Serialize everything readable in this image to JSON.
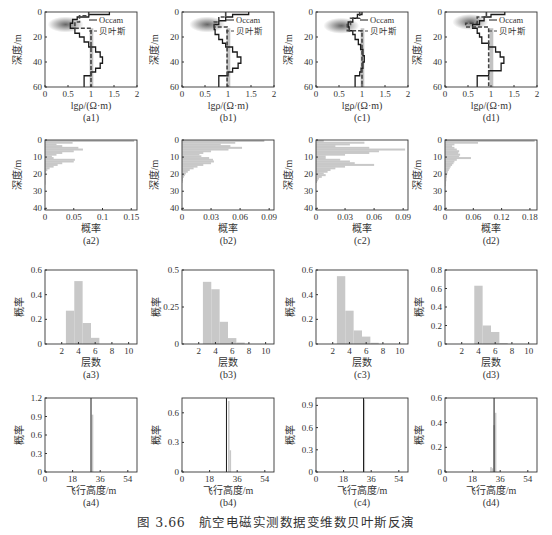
{
  "figure": {
    "caption": "图 3.66　航空电磁实测数据变维数贝叶斯反演"
  },
  "colors": {
    "frame": "#333333",
    "bar": "#c8c8c8",
    "occam": "#1a1a1a",
    "bayes": "#444444",
    "density": "#555555"
  },
  "chart_data": [
    {
      "id": "a1",
      "type": "line",
      "label": "(a1)",
      "xlabel": "lgρ/(Ω·m)",
      "ylabel": "深度/m",
      "xlim": [
        0,
        2
      ],
      "ylim": [
        60,
        0
      ],
      "xticks": [
        "0",
        "0.5",
        "1",
        "1.5",
        "2"
      ],
      "yticks": [
        "0",
        "20",
        "40",
        "60"
      ],
      "legend": [
        "Occam",
        "贝叶斯"
      ],
      "series": [
        {
          "name": "Occam",
          "steps": [
            [
              0,
              1.4
            ],
            [
              2,
              0.95
            ],
            [
              4,
              0.7
            ],
            [
              6,
              0.6
            ],
            [
              9,
              0.55
            ],
            [
              13,
              0.65
            ],
            [
              17,
              0.75
            ],
            [
              20,
              0.85
            ],
            [
              24,
              0.95
            ],
            [
              28,
              1.1
            ],
            [
              32,
              1.2
            ],
            [
              36,
              1.25
            ],
            [
              41,
              1.2
            ],
            [
              45,
              1.1
            ],
            [
              48,
              1.0
            ],
            [
              51,
              0.85
            ],
            [
              60,
              0.85
            ]
          ]
        },
        {
          "name": "贝叶斯",
          "steps": [
            [
              0,
              0.95
            ],
            [
              3,
              0.75
            ],
            [
              8,
              0.65
            ],
            [
              13,
              1.0
            ],
            [
              60,
              1.0
            ]
          ]
        }
      ],
      "density_center": {
        "x": 0.45,
        "depth": 10
      }
    },
    {
      "id": "b1",
      "type": "line",
      "label": "(b1)",
      "xlabel": "lgρ/(Ω·m)",
      "ylabel": "深度/m",
      "xlim": [
        0,
        2
      ],
      "ylim": [
        60,
        0
      ],
      "xticks": [
        "0",
        "0.5",
        "1",
        "1.5",
        "2"
      ],
      "yticks": [
        "0",
        "20",
        "40",
        "60"
      ],
      "legend": [
        "Occam",
        "贝叶斯"
      ],
      "series": [
        {
          "name": "Occam",
          "steps": [
            [
              0,
              1.45
            ],
            [
              2,
              1.1
            ],
            [
              4,
              0.95
            ],
            [
              7,
              0.8
            ],
            [
              10,
              0.7
            ],
            [
              14,
              0.72
            ],
            [
              18,
              0.8
            ],
            [
              22,
              0.88
            ],
            [
              25,
              0.95
            ],
            [
              28,
              1.1
            ],
            [
              32,
              1.2
            ],
            [
              36,
              1.28
            ],
            [
              41,
              1.22
            ],
            [
              45,
              1.1
            ],
            [
              48,
              1.0
            ],
            [
              51,
              0.8
            ],
            [
              60,
              0.8
            ]
          ]
        },
        {
          "name": "贝叶斯",
          "steps": [
            [
              0,
              0.95
            ],
            [
              4,
              0.8
            ],
            [
              8,
              0.7
            ],
            [
              12,
              0.98
            ],
            [
              60,
              0.98
            ]
          ]
        }
      ],
      "density_center": {
        "x": 0.55,
        "depth": 10
      }
    },
    {
      "id": "c1",
      "type": "line",
      "label": "(c1)",
      "xlabel": "lgρ/(Ω·m)",
      "ylabel": "深度/m",
      "xlim": [
        0,
        2
      ],
      "ylim": [
        60,
        0
      ],
      "xticks": [
        "0",
        "0.5",
        "1",
        "1.5",
        "2"
      ],
      "yticks": [
        "0",
        "20",
        "40",
        "60"
      ],
      "legend": [
        "Occam",
        "贝叶斯"
      ],
      "series": [
        {
          "name": "Occam",
          "steps": [
            [
              0,
              1.0
            ],
            [
              2,
              0.9
            ],
            [
              5,
              0.8
            ],
            [
              8,
              0.7
            ],
            [
              12,
              0.72
            ],
            [
              15,
              0.8
            ],
            [
              18,
              0.85
            ],
            [
              22,
              0.92
            ],
            [
              26,
              0.97
            ],
            [
              30,
              1.02
            ],
            [
              35,
              1.05
            ],
            [
              40,
              1.02
            ],
            [
              45,
              0.98
            ],
            [
              48,
              0.95
            ],
            [
              51,
              0.85
            ],
            [
              60,
              0.85
            ]
          ]
        },
        {
          "name": "贝叶斯",
          "steps": [
            [
              0,
              0.95
            ],
            [
              5,
              0.75
            ],
            [
              10,
              0.68
            ],
            [
              15,
              1.0
            ],
            [
              60,
              1.0
            ]
          ]
        }
      ],
      "density_center": {
        "x": 0.55,
        "depth": 11
      }
    },
    {
      "id": "d1",
      "type": "line",
      "label": "(d1)",
      "xlabel": "lgρ/(Ω·m)",
      "ylabel": "深度/m",
      "xlim": [
        0,
        2
      ],
      "ylim": [
        60,
        0
      ],
      "xticks": [
        "0",
        "0.5",
        "1",
        "1.5",
        "2"
      ],
      "yticks": [
        "0",
        "20",
        "40",
        "60"
      ],
      "legend": [
        "Occam",
        "贝叶斯"
      ],
      "series": [
        {
          "name": "Occam",
          "steps": [
            [
              0,
              1.3
            ],
            [
              2,
              1.0
            ],
            [
              4,
              0.85
            ],
            [
              7,
              0.75
            ],
            [
              10,
              0.6
            ],
            [
              13,
              0.7
            ],
            [
              17,
              0.75
            ],
            [
              20,
              0.8
            ],
            [
              25,
              0.95
            ],
            [
              28,
              1.1
            ],
            [
              32,
              1.2
            ],
            [
              36,
              1.28
            ],
            [
              41,
              1.22
            ],
            [
              47,
              0.95
            ],
            [
              51,
              0.7
            ],
            [
              60,
              0.7
            ]
          ]
        },
        {
          "name": "贝叶斯",
          "steps": [
            [
              0,
              0.9
            ],
            [
              4,
              0.7
            ],
            [
              9,
              0.45
            ],
            [
              12,
              0.95
            ],
            [
              60,
              0.95
            ]
          ]
        }
      ],
      "density_center": {
        "x": 0.55,
        "depth": 8
      }
    },
    {
      "id": "a2",
      "type": "bar",
      "orientation": "horizontal",
      "label": "(a2)",
      "xlabel": "概率",
      "ylabel": "深度/m",
      "xlim": [
        0,
        0.16
      ],
      "ylim": [
        41,
        0
      ],
      "xticks": [
        {
          "v": 0,
          "t": "0"
        },
        {
          "v": 0.05,
          "t": "0.05"
        },
        {
          "v": 0.1,
          "t": "0.1"
        },
        {
          "v": 0.15,
          "t": "0.15"
        }
      ],
      "yticks": [
        "0",
        "10",
        "20",
        "30",
        "40"
      ],
      "depths": [
        0,
        1,
        2,
        3,
        4,
        5,
        6,
        7,
        8,
        9,
        10,
        11,
        12,
        13,
        14,
        15,
        16,
        17,
        18,
        19,
        20,
        21,
        22,
        23,
        24,
        25
      ],
      "values": [
        0.155,
        0.048,
        0.02,
        0.03,
        0.058,
        0.066,
        0.05,
        0.03,
        0.02,
        0.012,
        0.015,
        0.052,
        0.05,
        0.03,
        0.022,
        0.015,
        0.008,
        0.004,
        0.002,
        0.001,
        0.001,
        0.001,
        0.0005,
        0.0005,
        0.0003,
        0.0002
      ]
    },
    {
      "id": "b2",
      "type": "bar",
      "orientation": "horizontal",
      "label": "(b2)",
      "xlabel": "概率",
      "ylabel": "深度/m",
      "xlim": [
        0,
        0.095
      ],
      "ylim": [
        41,
        0
      ],
      "xticks": [
        {
          "v": 0,
          "t": "0"
        },
        {
          "v": 0.03,
          "t": "0.03"
        },
        {
          "v": 0.06,
          "t": "0.06"
        },
        {
          "v": 0.09,
          "t": "0.09"
        }
      ],
      "yticks": [
        "0",
        "10",
        "20",
        "30",
        "40"
      ],
      "depths": [
        0,
        1,
        2,
        3,
        4,
        5,
        6,
        7,
        8,
        9,
        10,
        11,
        12,
        13,
        14,
        15,
        16,
        17,
        18,
        19,
        20,
        21,
        22,
        23,
        24
      ],
      "values": [
        0.085,
        0.055,
        0.04,
        0.05,
        0.062,
        0.048,
        0.03,
        0.022,
        0.018,
        0.02,
        0.028,
        0.032,
        0.033,
        0.03,
        0.022,
        0.016,
        0.012,
        0.008,
        0.006,
        0.004,
        0.003,
        0.002,
        0.001,
        0.001,
        0.0005
      ]
    },
    {
      "id": "c2",
      "type": "bar",
      "orientation": "horizontal",
      "label": "(c2)",
      "xlabel": "概率",
      "ylabel": "深度/m",
      "xlim": [
        0,
        0.095
      ],
      "ylim": [
        41,
        0
      ],
      "xticks": [
        {
          "v": 0,
          "t": "0"
        },
        {
          "v": 0.03,
          "t": "0.03"
        },
        {
          "v": 0.06,
          "t": "0.06"
        },
        {
          "v": 0.09,
          "t": "0.09"
        }
      ],
      "yticks": [
        "0",
        "10",
        "20",
        "30",
        "40"
      ],
      "depths": [
        0,
        1,
        2,
        3,
        4,
        5,
        6,
        7,
        8,
        9,
        10,
        11,
        12,
        13,
        14,
        15,
        16,
        17,
        18,
        19,
        20,
        21,
        22,
        23,
        24
      ],
      "values": [
        0.008,
        0.05,
        0.035,
        0.02,
        0.055,
        0.092,
        0.065,
        0.055,
        0.03,
        0.01,
        0.01,
        0.025,
        0.035,
        0.04,
        0.06,
        0.03,
        0.02,
        0.015,
        0.012,
        0.008,
        0.01,
        0.006,
        0.003,
        0.002,
        0.001
      ]
    },
    {
      "id": "d2",
      "type": "bar",
      "orientation": "horizontal",
      "label": "(d2)",
      "xlabel": "概率",
      "ylabel": "深度/m",
      "xlim": [
        0,
        0.195
      ],
      "ylim": [
        41,
        0
      ],
      "xticks": [
        {
          "v": 0,
          "t": "0"
        },
        {
          "v": 0.06,
          "t": "0.06"
        },
        {
          "v": 0.12,
          "t": "0.12"
        },
        {
          "v": 0.18,
          "t": "0.18"
        }
      ],
      "yticks": [
        "0",
        "10",
        "20",
        "30",
        "40"
      ],
      "depths": [
        0,
        1,
        2,
        3,
        4,
        5,
        6,
        7,
        8,
        9,
        10,
        11,
        12,
        13,
        14,
        15,
        16,
        17,
        18,
        19,
        20,
        21,
        22,
        23,
        24,
        25,
        26,
        27,
        28,
        29,
        30
      ],
      "values": [
        0.19,
        0.07,
        0.02,
        0.015,
        0.02,
        0.025,
        0.03,
        0.028,
        0.032,
        0.03,
        0.055,
        0.025,
        0.02,
        0.018,
        0.015,
        0.012,
        0.01,
        0.008,
        0.006,
        0.005,
        0.004,
        0.004,
        0.003,
        0.003,
        0.002,
        0.002,
        0.002,
        0.001,
        0.001,
        0.001,
        0.001
      ]
    },
    {
      "id": "a3",
      "type": "bar",
      "label": "(a3)",
      "xlabel": "层数",
      "ylabel": "概率",
      "xlim": [
        0,
        11
      ],
      "ylim": [
        0,
        0.6
      ],
      "xticks": [
        "2",
        "4",
        "6",
        "8",
        "10"
      ],
      "yticks": [
        "0",
        "0.2",
        "0.4",
        "0.6"
      ],
      "categories": [
        3,
        4,
        5,
        6
      ],
      "values": [
        0.27,
        0.51,
        0.17,
        0.05
      ]
    },
    {
      "id": "b3",
      "type": "bar",
      "label": "(b3)",
      "xlabel": "层数",
      "ylabel": "概率",
      "xlim": [
        0,
        11
      ],
      "ylim": [
        0,
        0.5
      ],
      "xticks": [
        "2",
        "4",
        "6",
        "8",
        "10"
      ],
      "yticks": [
        "0",
        "0.25",
        "0.5"
      ],
      "categories": [
        3,
        4,
        5,
        6,
        7
      ],
      "values": [
        0.42,
        0.37,
        0.15,
        0.04,
        0.01
      ]
    },
    {
      "id": "c3",
      "type": "bar",
      "label": "(c3)",
      "xlabel": "层数",
      "ylabel": "概率",
      "xlim": [
        0,
        11
      ],
      "ylim": [
        0,
        0.6
      ],
      "xticks": [
        "2",
        "4",
        "6",
        "8",
        "10"
      ],
      "yticks": [
        "0",
        "0.2",
        "0.4",
        "0.6"
      ],
      "categories": [
        3,
        4,
        5,
        6,
        7
      ],
      "values": [
        0.55,
        0.27,
        0.11,
        0.06,
        0.01
      ]
    },
    {
      "id": "d3",
      "type": "bar",
      "label": "(d3)",
      "xlabel": "层数",
      "ylabel": "概率",
      "xlim": [
        0,
        11
      ],
      "ylim": [
        0,
        0.8
      ],
      "xticks": [
        "2",
        "4",
        "6",
        "8",
        "10"
      ],
      "yticks": [
        "0",
        "0.2",
        "0.4",
        "0.6",
        "0.8"
      ],
      "categories": [
        4,
        5,
        6,
        7
      ],
      "values": [
        0.63,
        0.2,
        0.13,
        0.01
      ]
    },
    {
      "id": "a4",
      "type": "bar",
      "label": "(a4)",
      "xlabel": "飞行高度/m",
      "ylabel": "概率",
      "xlim": [
        0,
        60
      ],
      "ylim": [
        0,
        1.2
      ],
      "xticks": [
        {
          "v": 0,
          "t": "0"
        },
        {
          "v": 18,
          "t": "18"
        },
        {
          "v": 36,
          "t": "36"
        },
        {
          "v": 54,
          "t": "54"
        }
      ],
      "yticks": [
        {
          "v": 0,
          "t": "0"
        },
        {
          "v": 0.3,
          "t": "0.3"
        },
        {
          "v": 0.6,
          "t": "0.6"
        },
        {
          "v": 0.9,
          "t": "0.9"
        },
        {
          "v": 1.2,
          "t": "1.2"
        }
      ],
      "reference_line": 30,
      "categories": [
        31
      ],
      "values": [
        0.93
      ]
    },
    {
      "id": "b4",
      "type": "bar",
      "label": "(b4)",
      "xlabel": "飞行高度/m",
      "ylabel": "概率",
      "xlim": [
        0,
        60
      ],
      "ylim": [
        0,
        0.75
      ],
      "xticks": [
        {
          "v": 0,
          "t": "0"
        },
        {
          "v": 18,
          "t": "18"
        },
        {
          "v": 36,
          "t": "36"
        },
        {
          "v": 54,
          "t": "54"
        }
      ],
      "yticks": [
        {
          "v": 0,
          "t": "0"
        },
        {
          "v": 0.3,
          "t": "0.3"
        },
        {
          "v": 0.6,
          "t": "0.6"
        }
      ],
      "reference_line": 29,
      "categories": [
        30.5,
        31.5
      ],
      "values": [
        0.72,
        0.22
      ]
    },
    {
      "id": "c4",
      "type": "bar",
      "label": "(c4)",
      "xlabel": "飞行高度/m",
      "ylabel": "概率",
      "xlim": [
        0,
        60
      ],
      "ylim": [
        0,
        1.0
      ],
      "xticks": [
        {
          "v": 0,
          "t": "0"
        },
        {
          "v": 18,
          "t": "18"
        },
        {
          "v": 36,
          "t": "36"
        },
        {
          "v": 54,
          "t": "54"
        }
      ],
      "yticks": [
        {
          "v": 0,
          "t": "0"
        },
        {
          "v": 0.3,
          "t": "0.3"
        },
        {
          "v": 0.6,
          "t": "0.6"
        },
        {
          "v": 0.9,
          "t": "0.9"
        }
      ],
      "reference_line": 31,
      "categories": [
        31.5
      ],
      "values": [
        0.98
      ]
    },
    {
      "id": "d4",
      "type": "bar",
      "label": "(d4)",
      "xlabel": "飞行高度/m",
      "ylabel": "概率",
      "xlim": [
        0,
        60
      ],
      "ylim": [
        0,
        0.6
      ],
      "xticks": [
        {
          "v": 0,
          "t": "0"
        },
        {
          "v": 18,
          "t": "18"
        },
        {
          "v": 36,
          "t": "36"
        },
        {
          "v": 54,
          "t": "54"
        }
      ],
      "yticks": [
        {
          "v": 0,
          "t": "0"
        },
        {
          "v": 0.2,
          "t": "0.2"
        },
        {
          "v": 0.4,
          "t": "0.4"
        },
        {
          "v": 0.6,
          "t": "0.6"
        }
      ],
      "reference_line": 32,
      "categories": [
        30,
        31,
        32,
        33
      ],
      "values": [
        0.04,
        0.03,
        0.38,
        0.48
      ]
    }
  ]
}
